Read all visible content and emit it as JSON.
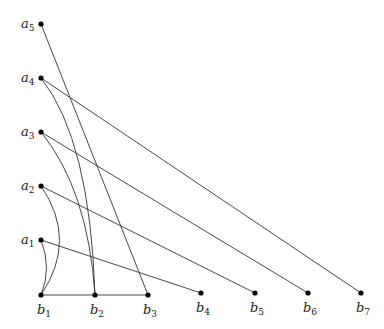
{
  "diagram": {
    "type": "bipartite-graph",
    "top_nodes": [
      {
        "id": "a5",
        "letter": "a",
        "sub": "5",
        "x": 41,
        "y": 24
      },
      {
        "id": "a4",
        "letter": "a",
        "sub": "4",
        "x": 41,
        "y": 78
      },
      {
        "id": "a3",
        "letter": "a",
        "sub": "3",
        "x": 41,
        "y": 132
      },
      {
        "id": "a2",
        "letter": "a",
        "sub": "2",
        "x": 41,
        "y": 186
      },
      {
        "id": "a1",
        "letter": "a",
        "sub": "1",
        "x": 41,
        "y": 240
      }
    ],
    "bottom_nodes": [
      {
        "id": "b1",
        "letter": "b",
        "sub": "1",
        "x": 41,
        "y": 295
      },
      {
        "id": "b2",
        "letter": "b",
        "sub": "2",
        "x": 95,
        "y": 295
      },
      {
        "id": "b3",
        "letter": "b",
        "sub": "3",
        "x": 148,
        "y": 295
      },
      {
        "id": "b4",
        "letter": "b",
        "sub": "4",
        "x": 201,
        "y": 293
      },
      {
        "id": "b5",
        "letter": "b",
        "sub": "5",
        "x": 255,
        "y": 293
      },
      {
        "id": "b6",
        "letter": "b",
        "sub": "6",
        "x": 308,
        "y": 293
      },
      {
        "id": "b7",
        "letter": "b",
        "sub": "7",
        "x": 361,
        "y": 293
      }
    ],
    "edges": [
      {
        "from": "a5",
        "to": "b3",
        "style": "straight"
      },
      {
        "from": "a4",
        "to": "b7",
        "style": "straight"
      },
      {
        "from": "a4",
        "to": "b2",
        "style": "curved"
      },
      {
        "from": "a3",
        "to": "b6",
        "style": "straight"
      },
      {
        "from": "a3",
        "to": "b2",
        "style": "curved"
      },
      {
        "from": "a2",
        "to": "b5",
        "style": "straight"
      },
      {
        "from": "a2",
        "to": "b1",
        "style": "curved"
      },
      {
        "from": "a1",
        "to": "b4",
        "style": "straight"
      },
      {
        "from": "a1",
        "to": "b1",
        "style": "curved"
      },
      {
        "from": "b1",
        "to": "b2",
        "style": "straight"
      },
      {
        "from": "b2",
        "to": "b3",
        "style": "straight"
      }
    ]
  },
  "labels": {
    "a5": {
      "letter": "a",
      "sub": "5"
    },
    "a4": {
      "letter": "a",
      "sub": "4"
    },
    "a3": {
      "letter": "a",
      "sub": "3"
    },
    "a2": {
      "letter": "a",
      "sub": "2"
    },
    "a1": {
      "letter": "a",
      "sub": "1"
    },
    "b1": {
      "letter": "b",
      "sub": "1"
    },
    "b2": {
      "letter": "b",
      "sub": "2"
    },
    "b3": {
      "letter": "b",
      "sub": "3"
    },
    "b4": {
      "letter": "b",
      "sub": "4"
    },
    "b5": {
      "letter": "b",
      "sub": "5"
    },
    "b6": {
      "letter": "b",
      "sub": "6"
    },
    "b7": {
      "letter": "b",
      "sub": "7"
    }
  }
}
